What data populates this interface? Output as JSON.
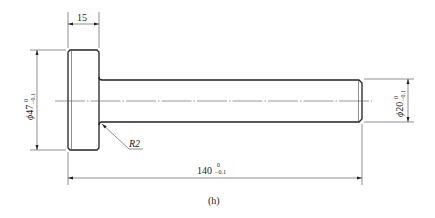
{
  "drawing": {
    "caption": "(h)",
    "dimensions": {
      "flange_width": {
        "value": "15"
      },
      "flange_diameter": {
        "symbol": "ϕ",
        "value": "47",
        "upper_tol": "0",
        "lower_tol": "−0.1"
      },
      "shaft_diameter": {
        "symbol": "ϕ",
        "value": "20",
        "upper_tol": "0",
        "lower_tol": "−0.1"
      },
      "total_length": {
        "value": "140",
        "upper_tol": "0",
        "lower_tol": "−0.1"
      },
      "fillet_radius": {
        "value": "R2"
      }
    },
    "colors": {
      "line": "#222222",
      "background": "#ffffff"
    }
  }
}
